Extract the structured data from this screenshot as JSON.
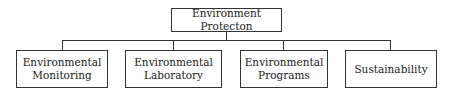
{
  "diagram": {
    "type": "org-chart",
    "root": {
      "label": "Environment Protecton"
    },
    "children": [
      {
        "label": "Environmental Monitoring",
        "line1": "Environmental",
        "line2": "Monitoring"
      },
      {
        "label": "Environmental Laboratory",
        "line1": "Environmental",
        "line2": "Laboratory"
      },
      {
        "label": "Environmental Programs",
        "line1": "Environmental",
        "line2": "Programs"
      },
      {
        "label": "Sustainability",
        "line1": "Sustainability",
        "line2": ""
      }
    ],
    "colors": {
      "stroke": "#333333",
      "background": "#ffffff",
      "text": "#222222"
    }
  }
}
